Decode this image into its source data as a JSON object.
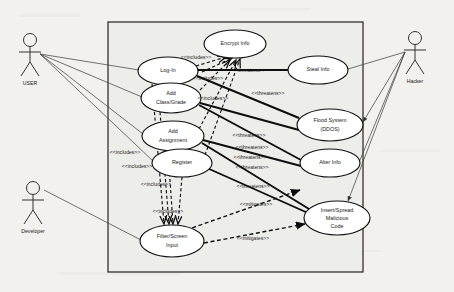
{
  "diagram": {
    "type": "uml-use-case-diagram",
    "background_color": "#f2f1ed",
    "boundary": {
      "name": "system-boundary",
      "x": 108,
      "y": 22,
      "width": 255,
      "height": 250,
      "fill": "#ededea",
      "stroke": "#222222"
    }
  },
  "actors": [
    {
      "id": "user",
      "label": "USER",
      "x": 30,
      "y": 55,
      "side": "left"
    },
    {
      "id": "developer",
      "label": "Developer",
      "x": 33,
      "y": 200,
      "side": "left"
    },
    {
      "id": "hacker",
      "label": "Hacker",
      "x": 412,
      "y": 52,
      "side": "right"
    }
  ],
  "use_cases": [
    {
      "id": "encrypt-info",
      "label": [
        "Encrypt Info"
      ],
      "cx": 235,
      "cy": 44,
      "rx": 31,
      "ry": 14
    },
    {
      "id": "log-in",
      "label": [
        "Log-In"
      ],
      "cx": 168,
      "cy": 71,
      "rx": 30,
      "ry": 14
    },
    {
      "id": "steal-info",
      "label": [
        "Steal Info"
      ],
      "cx": 318,
      "cy": 70,
      "rx": 30,
      "ry": 14
    },
    {
      "id": "add-class-grade",
      "label": [
        "Add",
        "Class/Grade"
      ],
      "cx": 171,
      "cy": 98,
      "rx": 30,
      "ry": 15
    },
    {
      "id": "flood-system-ddos",
      "label": [
        "Flood System",
        "(DDOS)"
      ],
      "cx": 330,
      "cy": 125,
      "rx": 33,
      "ry": 16
    },
    {
      "id": "add-assignment",
      "label": [
        "Add",
        "Assignment"
      ],
      "cx": 173,
      "cy": 136,
      "rx": 31,
      "ry": 15
    },
    {
      "id": "register",
      "label": [
        "Register"
      ],
      "cx": 182,
      "cy": 163,
      "rx": 30,
      "ry": 14
    },
    {
      "id": "alter-info",
      "label": [
        "Alter Info"
      ],
      "cx": 330,
      "cy": 163,
      "rx": 30,
      "ry": 14
    },
    {
      "id": "insert-spread-malicious-code",
      "label": [
        "Insert/Spread",
        "Malicious",
        "Code"
      ],
      "cx": 337,
      "cy": 218,
      "rx": 33,
      "ry": 17
    },
    {
      "id": "filter-screen-input",
      "label": [
        "Filter/Screen",
        "Input"
      ],
      "cx": 172,
      "cy": 241,
      "rx": 32,
      "ry": 16
    }
  ],
  "stereotype_labels": [
    {
      "id": "includes-1",
      "text": "<<includes>>",
      "x": 196,
      "y": 58
    },
    {
      "id": "includes-2",
      "text": "<<includes>>",
      "x": 208,
      "y": 79
    },
    {
      "id": "includes-3",
      "text": "<<includes>>",
      "x": 213,
      "y": 99
    },
    {
      "id": "includes-4",
      "text": "<<includes>>",
      "x": 125,
      "y": 153
    },
    {
      "id": "includes-5",
      "text": "<<includes>>",
      "x": 137,
      "y": 167
    },
    {
      "id": "includes-6",
      "text": "<<includes>>",
      "x": 156,
      "y": 185
    },
    {
      "id": "includes-7",
      "text": "<<includes>>",
      "x": 168,
      "y": 212
    },
    {
      "id": "threatens-1",
      "text": "<<threatens>>",
      "x": 249,
      "y": 71
    },
    {
      "id": "threatens-2",
      "text": "<<threatens>>",
      "x": 268,
      "y": 94
    },
    {
      "id": "threatens-3",
      "text": "<<threatens>>",
      "x": 249,
      "y": 136
    },
    {
      "id": "threatens-4",
      "text": "<<threatens>>",
      "x": 252,
      "y": 148
    },
    {
      "id": "threatens-5",
      "text": "<<threatens>>",
      "x": 250,
      "y": 158
    },
    {
      "id": "threatens-6",
      "text": "<<threatens>>",
      "x": 252,
      "y": 168
    },
    {
      "id": "threatens-7",
      "text": "<<threatens>>",
      "x": 253,
      "y": 187
    },
    {
      "id": "mitigates-1",
      "text": "<<mitigates>>",
      "x": 256,
      "y": 205
    },
    {
      "id": "mitigates-2",
      "text": "<<mitigates>>",
      "x": 253,
      "y": 239
    }
  ],
  "relationships": {
    "association_color": "#444444",
    "threatens_color": "#0d0d0d",
    "includes_style": "dashed-arrow",
    "mitigates_style": "dashed-arrow"
  }
}
